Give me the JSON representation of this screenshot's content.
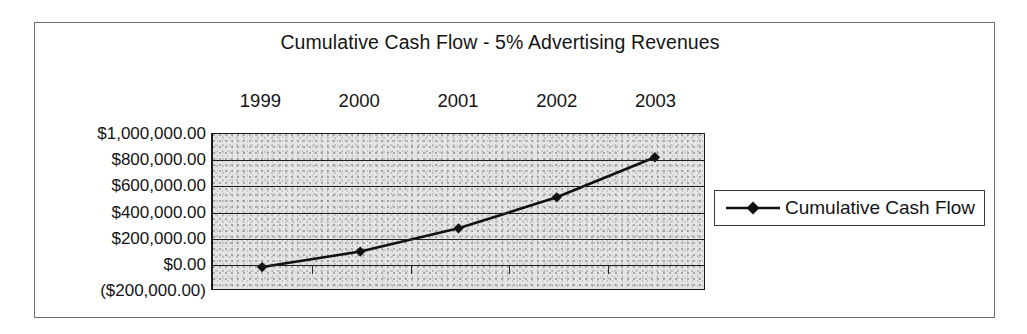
{
  "figure": {
    "title": "Cumulative Cash Flow - 5% Advertising Revenues"
  },
  "legend": {
    "entries": [
      {
        "label": "Cumulative Cash Flow",
        "marker": "diamond-marker-icon",
        "color": "#111111"
      }
    ]
  },
  "axis": {
    "y_tick_labels": [
      "$1,000,000.00",
      "$800,000.00",
      "$600,000.00",
      "$400,000.00",
      "$200,000.00",
      "$0.00",
      "($200,000.00)"
    ],
    "x_tick_labels": [
      "1999",
      "2000",
      "2001",
      "2002",
      "2003"
    ]
  },
  "chart_data": {
    "type": "line",
    "title": "Cumulative Cash Flow - 5% Advertising Revenues",
    "xlabel": "",
    "ylabel": "",
    "categories": [
      "1999",
      "2000",
      "2001",
      "2002",
      "2003"
    ],
    "series": [
      {
        "name": "Cumulative Cash Flow",
        "values": [
          -30000,
          90000,
          270000,
          510000,
          820000
        ],
        "marker": "diamond",
        "color": "#111111"
      }
    ],
    "ylim": [
      -200000,
      1000000
    ],
    "ytick_values": [
      1000000,
      800000,
      600000,
      400000,
      200000,
      0,
      -200000
    ],
    "ytick_labels": [
      "$1,000,000.00",
      "$800,000.00",
      "$600,000.00",
      "$400,000.00",
      "$200,000.00",
      "$0.00",
      "($200,000.00)"
    ],
    "grid": true,
    "grid_axis": "y",
    "legend_position": "right",
    "x_axis_label_position": "top",
    "plot_background": "#e4e4e4"
  }
}
